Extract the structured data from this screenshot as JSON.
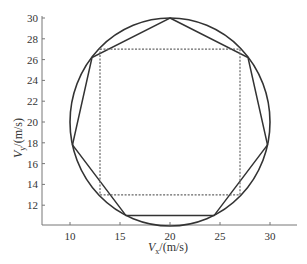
{
  "chart_data": {
    "type": "line",
    "title": "",
    "xlabel": "V_x/(m/s)",
    "ylabel": "V_y/(m/s)",
    "xlim": [
      7.2,
      32.7
    ],
    "ylim": [
      10.1,
      30
    ],
    "xticks": [
      10,
      15,
      20,
      25,
      30
    ],
    "yticks": [
      12,
      14,
      16,
      18,
      20,
      22,
      24,
      26,
      28,
      30
    ],
    "grid": false,
    "legend": null,
    "series": [
      {
        "name": "circle",
        "kind": "circle",
        "center": [
          20,
          20
        ],
        "radius": 10,
        "style": "solid"
      },
      {
        "name": "heptagon",
        "kind": "polygon",
        "style": "solid",
        "points": [
          [
            20,
            30
          ],
          [
            27.8,
            26.2
          ],
          [
            29.75,
            17.8
          ],
          [
            24.4,
            11
          ],
          [
            15.6,
            11
          ],
          [
            10.25,
            17.8
          ],
          [
            12.2,
            26.2
          ]
        ]
      },
      {
        "name": "square",
        "kind": "polygon",
        "style": "dashed",
        "points": [
          [
            13,
            27
          ],
          [
            27,
            27
          ],
          [
            27,
            13
          ],
          [
            13,
            13
          ]
        ]
      }
    ]
  },
  "axes": {
    "x_label_main": "V",
    "x_label_sub": "x",
    "x_label_unit": "/(m/s)",
    "y_label_main": "V",
    "y_label_sub": "y",
    "y_label_unit": "/(m/s)",
    "x_tick_labels": [
      "10",
      "15",
      "20",
      "25",
      "30"
    ],
    "y_tick_labels": [
      "12",
      "14",
      "16",
      "18",
      "20",
      "22",
      "24",
      "26",
      "28",
      "30"
    ]
  }
}
